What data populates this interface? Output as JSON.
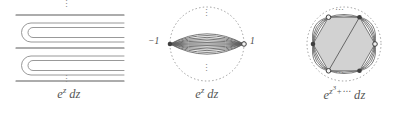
{
  "figure": {
    "width": 413,
    "height": 119,
    "background": "#ffffff",
    "ink": "#4a4a4a",
    "fill": "#d4d4d4",
    "dotted": "#9a9a9a"
  },
  "panels": [
    {
      "id": "panel-1",
      "name": "parallel-hairpin-contours",
      "caption_plain": "e^z dz",
      "caption": {
        "base": "e",
        "exponent": "z",
        "differential": "dz"
      },
      "ellipsis_top": "⋮",
      "ellipsis_bottom": "⋮",
      "description": "Three horizontal straight contour lines with two nested hairpin (U-turn) contours opening to the right between them",
      "straight_lines_y": [
        14,
        47,
        80
      ],
      "hairpin_count": 2,
      "strands_per_hairpin": 2
    },
    {
      "id": "panel-2",
      "name": "lens-thimble-bundle",
      "caption_plain": "e^z dz",
      "caption": {
        "base": "e",
        "exponent": "z",
        "differential": "dz"
      },
      "left_label": "−1",
      "right_label": "1",
      "ellipsis_top": "⋮",
      "ellipsis_bottom": "⋮",
      "description": "Dotted circle containing a lens shaped bundle of arcs joining two marked points on the real axis",
      "arc_count": 13,
      "circle_radius": 39
    },
    {
      "id": "panel-3",
      "name": "hexagon-thimble-bundle",
      "caption_plain": "e^{z^3+⋯} dz",
      "caption": {
        "base": "e",
        "exponent_base": "z",
        "exponent_power": "3",
        "exponent_tail": "+⋯",
        "differential": "dz"
      },
      "ellipsis_top": "⋯",
      "ellipsis_bottom": "⋯",
      "description": "Dotted circle with six marked vertices forming a shaded hexagon, bundles of outward bulging arcs between adjacent vertices, and a diagonal chord",
      "vertex_count": 6,
      "arcs_per_edge": 4,
      "diagonal_chords": 1,
      "circle_radius": 39
    }
  ]
}
